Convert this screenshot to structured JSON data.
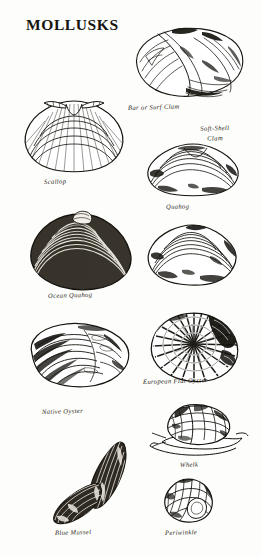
{
  "plate": {
    "title": "MOLLUSKS",
    "background_color": "#fdfdfb",
    "ink_color": "#16140f",
    "width": 262,
    "height": 557
  },
  "specimens": [
    {
      "id": "bar-or-surf-clam",
      "caption": "Bar or Surf Clam",
      "shape": "bivalve-oval-clam",
      "caption_x": 128,
      "caption_y": 104
    },
    {
      "id": "scallop",
      "caption": "Scallop",
      "shape": "scallop-fan",
      "caption_x": 44,
      "caption_y": 178
    },
    {
      "id": "soft-shell-clam",
      "caption": "Soft-Shell Clam",
      "caption_line_1": "Soft-Shell",
      "caption_line_2": "Clam",
      "shape": "bivalve-rounded-clam",
      "caption_x": 196,
      "caption_y": 128
    },
    {
      "id": "quahog",
      "caption": "Quahog",
      "shape": "bivalve-quahog",
      "caption_x": 166,
      "caption_y": 203
    },
    {
      "id": "ocean-quahog",
      "caption": "Ocean Quahog",
      "shape": "bivalve-dark-ringed-clam",
      "caption_x": 48,
      "caption_y": 293
    },
    {
      "id": "european-flat-oyster",
      "caption": "European Flat Oyster",
      "shape": "oyster-round-radial",
      "caption_x": 143,
      "caption_y": 378
    },
    {
      "id": "native-oyster",
      "caption": "Native Oyster",
      "shape": "oyster-elongated",
      "caption_x": 42,
      "caption_y": 409
    },
    {
      "id": "whelk",
      "caption": "Whelk",
      "shape": "gastropod-spiral-whelk",
      "caption_x": 180,
      "caption_y": 461
    },
    {
      "id": "blue-mussel",
      "caption": "Blue Mussel",
      "shape": "mussel-pair-elongated",
      "caption_x": 55,
      "caption_y": 530
    },
    {
      "id": "periwinkle",
      "caption": "Periwinkle",
      "shape": "gastropod-small-snail",
      "caption_x": 165,
      "caption_y": 530
    }
  ]
}
